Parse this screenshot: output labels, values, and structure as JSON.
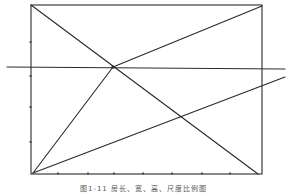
{
  "figure": {
    "caption": "图1-11  房长、宽、高、尺度比例图",
    "ink_color": "#2a2a2a",
    "background": "#ffffff"
  },
  "diagram": {
    "frame": {
      "x1": 31,
      "y1": 5,
      "x2": 262,
      "y2": 174
    },
    "lines": [
      {
        "name": "diagonal-top-left-to-bottom-right",
        "x1": 31,
        "y1": 5,
        "x2": 258,
        "y2": 174
      },
      {
        "name": "horizontal-reference-line",
        "x1": 7,
        "y1": 67,
        "x2": 285,
        "y2": 69
      },
      {
        "name": "line-bottom-left-to-intersection",
        "x1": 33,
        "y1": 173,
        "x2": 113,
        "y2": 67
      },
      {
        "name": "line-intersection-to-top-right",
        "x1": 113,
        "y1": 67,
        "x2": 262,
        "y2": 6
      },
      {
        "name": "line-bottom-left-to-right-edge",
        "x1": 33,
        "y1": 173,
        "x2": 285,
        "y2": 77
      }
    ],
    "intersection_points": [
      {
        "name": "upper-intersection",
        "x": 113,
        "y": 67
      },
      {
        "name": "lower-intersection",
        "x": 180,
        "y": 117
      }
    ],
    "left_ticks_y": [
      42,
      76,
      107,
      142
    ],
    "bottom_ticks_x": [
      58,
      88,
      114,
      143,
      172,
      202,
      230
    ]
  }
}
